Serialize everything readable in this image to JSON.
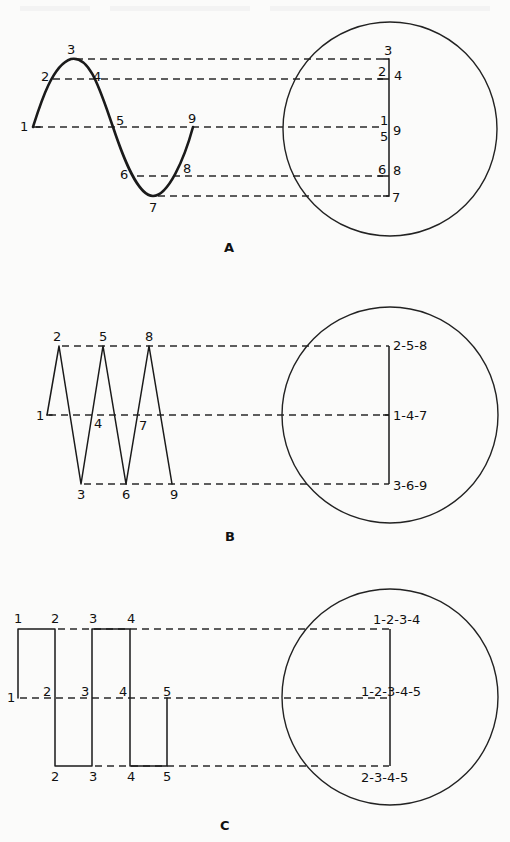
{
  "figure": {
    "panels": [
      {
        "id": "A",
        "caption": "A",
        "waveform": "sine",
        "levels": {
          "top": 3,
          "upper": 2,
          "mid": 1,
          "lower": 6,
          "bottom": 7
        },
        "point_labels": [
          "1",
          "2",
          "3",
          "4",
          "5",
          "6",
          "7",
          "8",
          "9"
        ],
        "screen_labels": {
          "top": "3",
          "upper_left": "2",
          "upper_right": "4",
          "mid_left_top": "1",
          "mid_left_bottom": "5",
          "mid_right": "9",
          "lower_left": "6",
          "lower_right": "8",
          "bottom": "7"
        }
      },
      {
        "id": "B",
        "caption": "B",
        "waveform": "triangle",
        "point_labels": [
          "1",
          "2",
          "3",
          "4",
          "5",
          "6",
          "7",
          "8",
          "9"
        ],
        "screen_labels": {
          "top": "2-5-8",
          "mid": "1-4-7",
          "bottom": "3-6-9"
        }
      },
      {
        "id": "C",
        "caption": "C",
        "waveform": "square",
        "point_labels_top": [
          "1",
          "2",
          "3",
          "4"
        ],
        "point_labels_mid": [
          "1",
          "2",
          "3",
          "4",
          "5"
        ],
        "point_labels_bottom": [
          "2",
          "3",
          "4",
          "5"
        ],
        "screen_labels": {
          "top": "1-2-3-4",
          "mid": "1-2-3-4-5",
          "bottom": "2-3-4-5"
        }
      }
    ]
  }
}
